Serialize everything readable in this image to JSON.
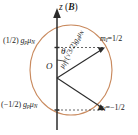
{
  "figure": {
    "axis": {
      "name": "z-axis",
      "label_symbol": "z",
      "field_symbol": "B",
      "label_full": "z (B)"
    },
    "origin_label": "O",
    "angle_label": "θ",
    "projection_upper": {
      "coefficient": "(1/2)",
      "g_symbol": "g",
      "g_subscript": "p",
      "mu_symbol": "μ",
      "mu_subscript": "N",
      "text": "(1/2) gₒμₙ"
    },
    "projection_lower": {
      "coefficient": "(−1/2)",
      "g_symbol": "g",
      "g_subscript": "p",
      "mu_symbol": "μ",
      "mu_subscript": "N",
      "text": "(−1/2) gₒμₙ"
    },
    "state_upper": {
      "symbol": "m",
      "subscript": "I",
      "value": "=1/2",
      "text": "mᵢ=1/2"
    },
    "state_lower": {
      "symbol": "m",
      "subscript": "I",
      "value": "=−1/2",
      "text": "mᵢ=−1/2"
    },
    "moment_vector": {
      "symbol": "μ",
      "subscript": "I",
      "equals": "=",
      "magnitude": "(√3/2)",
      "g_symbol": "g",
      "g_subscript": "p",
      "mu_symbol": "μ",
      "mu_subscript": "N",
      "text": "μᵢ=(√3/2)gₒμₙ"
    },
    "colors": {
      "arc": "#c98a5e",
      "axis": "#2b2b2b",
      "vector": "#2b2b2b",
      "dashed": "#555555",
      "text": "#1a1a1a",
      "background": "#ffffff"
    }
  }
}
